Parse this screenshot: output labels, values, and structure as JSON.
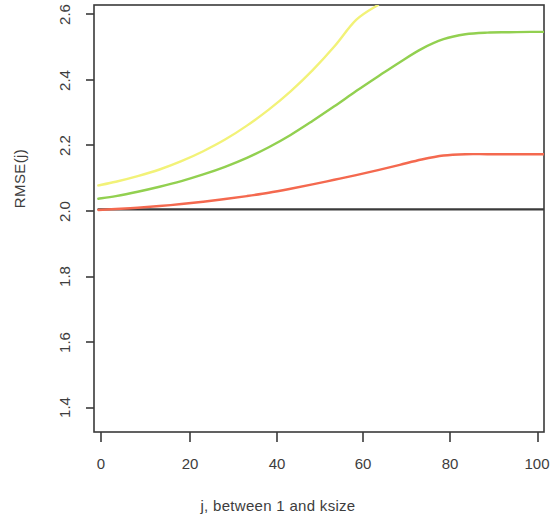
{
  "chart_data": {
    "type": "line",
    "title": "",
    "xlabel": "j, between 1 and ksize",
    "ylabel": "RMSE(j)",
    "xlim": [
      0,
      103
    ],
    "ylim": [
      1.33,
      2.615
    ],
    "grid": false,
    "legend": "none",
    "xticks": [
      0,
      20,
      40,
      60,
      80,
      100
    ],
    "xtick_labels": [
      "0",
      "20",
      "40",
      "60",
      "80",
      "100"
    ],
    "yticks": [
      1.4,
      1.6,
      1.8,
      2.0,
      2.2,
      2.4,
      2.6
    ],
    "ytick_labels": [
      "1.4",
      "1.6",
      "1.8",
      "2.0",
      "2.2",
      "2.4",
      "2.6"
    ],
    "x": [
      1,
      5,
      10,
      15,
      20,
      25,
      30,
      35,
      40,
      45,
      50,
      55,
      60,
      65,
      70,
      75,
      80,
      85,
      90,
      95,
      100,
      103
    ],
    "series": [
      {
        "name": "black-baseline",
        "color": "#3a3a3a",
        "values": [
          2.0,
          2.0,
          2.0,
          2.0,
          2.0,
          2.0,
          2.0,
          2.0,
          2.0,
          2.0,
          2.0,
          2.0,
          2.0,
          2.0,
          2.0,
          2.0,
          2.0,
          2.0,
          2.0,
          2.0,
          2.0,
          2.0
        ]
      },
      {
        "name": "red-curve",
        "color": "#f4694f",
        "values": [
          1.998,
          2.001,
          2.005,
          2.01,
          2.016,
          2.023,
          2.031,
          2.04,
          2.05,
          2.062,
          2.075,
          2.089,
          2.103,
          2.118,
          2.134,
          2.15,
          2.162,
          2.166,
          2.166,
          2.166,
          2.166,
          2.166
        ]
      },
      {
        "name": "green-curve",
        "color": "#92d050",
        "values": [
          2.032,
          2.04,
          2.053,
          2.068,
          2.085,
          2.105,
          2.128,
          2.155,
          2.187,
          2.224,
          2.266,
          2.31,
          2.356,
          2.4,
          2.443,
          2.483,
          2.512,
          2.527,
          2.532,
          2.533,
          2.534,
          2.534
        ]
      },
      {
        "name": "yellow-curve",
        "color": "#f2f278",
        "values": [
          2.072,
          2.083,
          2.1,
          2.12,
          2.145,
          2.175,
          2.21,
          2.252,
          2.3,
          2.355,
          2.418,
          2.49,
          2.57,
          2.615,
          null,
          null,
          null,
          null,
          null,
          null,
          null,
          null
        ],
        "note": "clipped at top of axis near j = 68"
      }
    ]
  },
  "axes": {
    "ylabel": "RMSE(j)",
    "xlabel": "j, between 1 and ksize",
    "ytick_labels": [
      "2.6",
      "2.4",
      "2.2",
      "2.0",
      "1.8",
      "1.6",
      "1.4"
    ],
    "xtick_labels": [
      "0",
      "20",
      "40",
      "60",
      "80",
      "100"
    ]
  }
}
